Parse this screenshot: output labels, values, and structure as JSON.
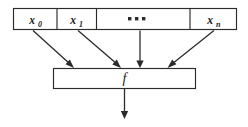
{
  "diagram": {
    "colors": {
      "background": "#ffffff",
      "stroke": "#2b2b2b",
      "text": "#1c1c1c",
      "fill": "#ffffff"
    },
    "input_bar": {
      "name": "input-vector-bar",
      "cells": [
        {
          "id": "x0",
          "base": "x",
          "subscript": "0",
          "kind": "variable"
        },
        {
          "id": "x1",
          "base": "x",
          "subscript": "1",
          "kind": "variable"
        },
        {
          "id": "ellipsis",
          "base": "",
          "subscript": "",
          "kind": "ellipsis",
          "glyph": "▪ ▪ ▪"
        },
        {
          "id": "xn",
          "base": "x",
          "subscript": "n",
          "kind": "variable"
        }
      ]
    },
    "function_box": {
      "name": "function-box",
      "label": "f"
    },
    "arrows": {
      "inputs": [
        {
          "from": "x0",
          "to": "function-box",
          "direction": "diagonal-down-right"
        },
        {
          "from": "x1",
          "to": "function-box",
          "direction": "diagonal-down-right"
        },
        {
          "from": "ellipsis",
          "to": "function-box",
          "direction": "vertical-down"
        },
        {
          "from": "xn",
          "to": "function-box",
          "direction": "diagonal-down-left"
        }
      ],
      "output": {
        "from": "function-box",
        "to": "result",
        "direction": "vertical-down"
      }
    }
  }
}
